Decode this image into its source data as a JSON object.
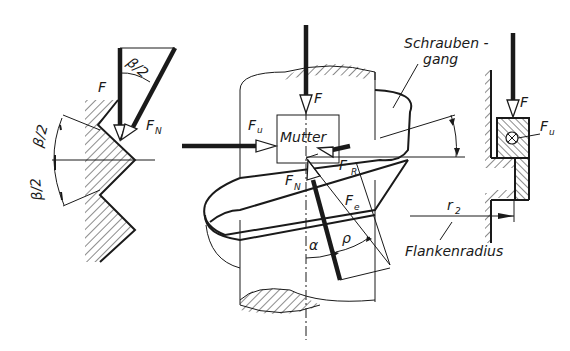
{
  "figure": {
    "colors": {
      "ink": "#1a1a1a",
      "background": "#ffffff"
    }
  },
  "left_detail": {
    "labels": {
      "force": "F",
      "normal_force": "F",
      "normal_force_sub": "N",
      "half_angle_top": "β/2",
      "half_angle_upper": "β/2",
      "half_angle_lower": "β/2"
    }
  },
  "center_detail": {
    "labels": {
      "force": "F",
      "circumferential_force": "F",
      "circumferential_force_sub": "u",
      "nut": "Mutter",
      "reaction_force": "-F",
      "reaction_force_sub": "R",
      "normal_force": "F",
      "normal_force_sub": "N",
      "resultant_force": "F",
      "resultant_force_sub": "e",
      "lead_angle": "α",
      "friction_angle": "ρ",
      "thread_line_top": "Schrauben -",
      "thread_line_bottom": "gang"
    }
  },
  "right_detail": {
    "labels": {
      "force": "F",
      "circumferential_force": "F",
      "circumferential_force_sub": "u",
      "radius": "r",
      "radius_sub": "2",
      "flank_radius": "Flankenradius"
    }
  }
}
